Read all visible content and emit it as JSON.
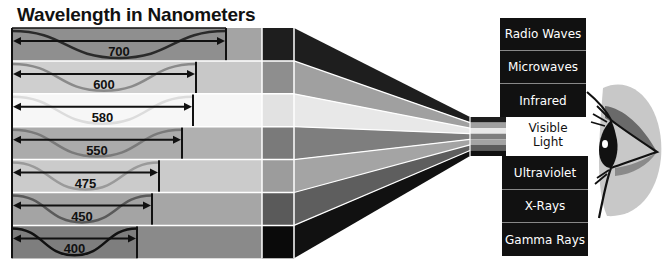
{
  "title": "Wavelength in Nanometers",
  "bands": [
    {
      "label": "700",
      "end_x": 226,
      "wave": "#2a2a2a",
      "fill": "#8f8f8f",
      "mid": "#a4a4a4",
      "dark": "#1e1e1e",
      "funnel": "#1e1e1e"
    },
    {
      "label": "600",
      "end_x": 196,
      "wave": "#8a8a8a",
      "fill": "#cfcfcf",
      "mid": "#c8c8c8",
      "dark": "#8e8e8e",
      "funnel": "#a0a0a0"
    },
    {
      "label": "580",
      "end_x": 193,
      "wave": "#dcdcdc",
      "fill": "#f7f7f7",
      "mid": "#f6f6f6",
      "dark": "#e2e2e2",
      "funnel": "#e8e8e8"
    },
    {
      "label": "550",
      "end_x": 182,
      "wave": "#7a7a7a",
      "fill": "#ababab",
      "mid": "#b0b0b0",
      "dark": "#7a7a7a",
      "funnel": "#7e7e7e"
    },
    {
      "label": "475",
      "end_x": 159,
      "wave": "#9a9a9a",
      "fill": "#cbcbcb",
      "mid": "#cbcbcb",
      "dark": "#9c9c9c",
      "funnel": "#a4a4a4"
    },
    {
      "label": "450",
      "end_x": 152,
      "wave": "#5a5a5a",
      "fill": "#a4a4a4",
      "mid": "#a6a6a6",
      "dark": "#5a5a5a",
      "funnel": "#5e5e5e"
    },
    {
      "label": "400",
      "end_x": 137,
      "wave": "#111111",
      "fill": "#7e7e7e",
      "mid": "#8a8a8a",
      "dark": "#0a0a0a",
      "funnel": "#111111"
    }
  ],
  "spectrum": {
    "upper": [
      "Radio Waves",
      "Microwaves",
      "Infrared"
    ],
    "visible": [
      "Visible",
      "Light"
    ],
    "lower": [
      "Ultraviolet",
      "X-Rays",
      "Gamma Rays"
    ]
  }
}
